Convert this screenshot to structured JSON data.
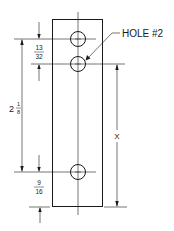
{
  "drawing": {
    "title": "Plate with three holes",
    "callout": {
      "label": "HOLE #2"
    },
    "dimensions": {
      "top_offset": {
        "numerator": "13",
        "denominator": "32"
      },
      "overall_hole_span": {
        "whole": "2",
        "numerator": "1",
        "denominator": "8"
      },
      "bottom_offset": {
        "numerator": "9",
        "denominator": "16"
      },
      "unknown": {
        "label": "X"
      }
    },
    "colors": {
      "line": "#1a1a1a",
      "background": "#ffffff"
    }
  }
}
